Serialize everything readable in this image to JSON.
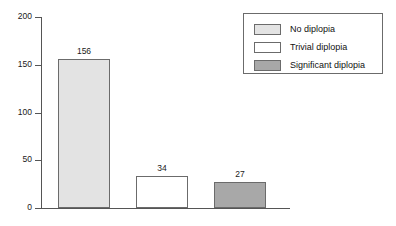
{
  "chart_data": {
    "type": "bar",
    "title": "",
    "xlabel": "",
    "ylabel": "",
    "categories": [
      "No diplopia",
      "Trivial diplopia",
      "Significant diplopia"
    ],
    "values": [
      156,
      34,
      27
    ],
    "value_labels": [
      "156",
      "34",
      "27"
    ],
    "ylim": [
      0,
      200
    ],
    "yticks": [
      0,
      50,
      100,
      150,
      200
    ],
    "ytick_labels": [
      "0",
      "50",
      "100",
      "150",
      "200"
    ],
    "grid": false,
    "legend_position": "top-right",
    "series": [
      {
        "name": "No diplopia",
        "value": 156,
        "color": "#e3e3e3",
        "edge_color": "#6b6b6b"
      },
      {
        "name": "Trivial diplopia",
        "value": 34,
        "color": "#ffffff",
        "edge_color": "#6b6b6b"
      },
      {
        "name": "Significant diplopia",
        "value": 27,
        "color": "#a8a8a8",
        "edge_color": "#6b6b6b"
      }
    ]
  },
  "legend": {
    "items": [
      {
        "label": "No diplopia",
        "color": "#e3e3e3"
      },
      {
        "label": "Trivial diplopia",
        "color": "#ffffff"
      },
      {
        "label": "Significant diplopia",
        "color": "#a8a8a8"
      }
    ]
  },
  "colors": {
    "axis": "#555555",
    "text": "#1a1a1a",
    "background": "#ffffff",
    "bar_edge": "#6b6b6b"
  }
}
